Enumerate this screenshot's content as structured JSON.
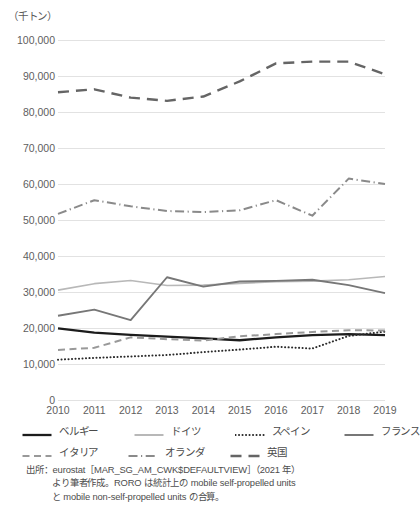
{
  "chart_data": {
    "type": "line",
    "title": "",
    "subtitle": "",
    "unit_label": "（千トン）",
    "xlabel": "",
    "ylabel": "",
    "x": [
      2010,
      2011,
      2012,
      2013,
      2014,
      2015,
      2016,
      2017,
      2018,
      2019
    ],
    "categories": [
      "2010",
      "2011",
      "2012",
      "2013",
      "2014",
      "2015",
      "2016",
      "2017",
      "2018",
      "2019"
    ],
    "ylim": [
      0,
      100000
    ],
    "ytick_values": [
      0,
      10000,
      20000,
      30000,
      40000,
      50000,
      60000,
      70000,
      80000,
      90000,
      100000
    ],
    "ytick_labels": [
      "0",
      "10,000",
      "20,000",
      "30,000",
      "40,000",
      "50,000",
      "60,000",
      "70,000",
      "80,000",
      "90,000",
      "100,000"
    ],
    "grid": true,
    "grid_axis": "y",
    "legend_position": "bottom",
    "series": [
      {
        "name": "ベルギー",
        "values": [
          19900,
          18700,
          18100,
          17600,
          17100,
          16600,
          17400,
          18000,
          18300,
          18000
        ],
        "color": "#1c1c1c",
        "width": 2.3,
        "dash": "none"
      },
      {
        "name": "ドイツ",
        "values": [
          30500,
          32300,
          33200,
          31800,
          31900,
          32400,
          32900,
          33000,
          33400,
          34300
        ],
        "color": "#b8b8b8",
        "width": 1.7,
        "dash": "none"
      },
      {
        "name": "スペイン",
        "values": [
          11200,
          11700,
          12100,
          12500,
          13300,
          14000,
          14800,
          14300,
          17800,
          19000
        ],
        "color": "#2a2a2a",
        "width": 2.0,
        "dash": "dotted"
      },
      {
        "name": "フランス",
        "values": [
          23400,
          25100,
          22200,
          34100,
          31500,
          32900,
          33100,
          33400,
          31900,
          29700
        ],
        "color": "#777777",
        "width": 1.9,
        "dash": "none"
      },
      {
        "name": "イタリア",
        "values": [
          13900,
          14500,
          17400,
          16900,
          16500,
          17700,
          18300,
          18900,
          19400,
          19300
        ],
        "color": "#999999",
        "width": 2.0,
        "dash": "dashed-short"
      },
      {
        "name": "オランダ",
        "values": [
          51700,
          55500,
          53800,
          52500,
          52200,
          52700,
          55500,
          51200,
          61500,
          60000
        ],
        "color": "#8a8a8a",
        "width": 2.0,
        "dash": "dashdot"
      },
      {
        "name": "英国",
        "values": [
          85500,
          86300,
          84000,
          83100,
          84300,
          88500,
          93500,
          94000,
          94000,
          90500
        ],
        "color": "#656565",
        "width": 2.4,
        "dash": "dashed-long"
      }
    ]
  },
  "legend": {
    "rows": [
      [
        {
          "label": "ベルギー",
          "series": 0
        },
        {
          "label": "ドイツ",
          "series": 1
        },
        {
          "label": "スペイン",
          "series": 2
        },
        {
          "label": "フランス",
          "series": 3
        }
      ],
      [
        {
          "label": "イタリア",
          "series": 4
        },
        {
          "label": "オランダ",
          "series": 5
        },
        {
          "label": "英国",
          "series": 6
        }
      ]
    ]
  },
  "source_note": {
    "line1": "出所：eurostat［MAR_SG_AM_CWK$DEFAULTVIEW］（2021 年）",
    "line2": "より筆者作成。RORO は統計上の mobile self-propelled units",
    "line3": "と mobile non-self-propelled units の合算。"
  }
}
